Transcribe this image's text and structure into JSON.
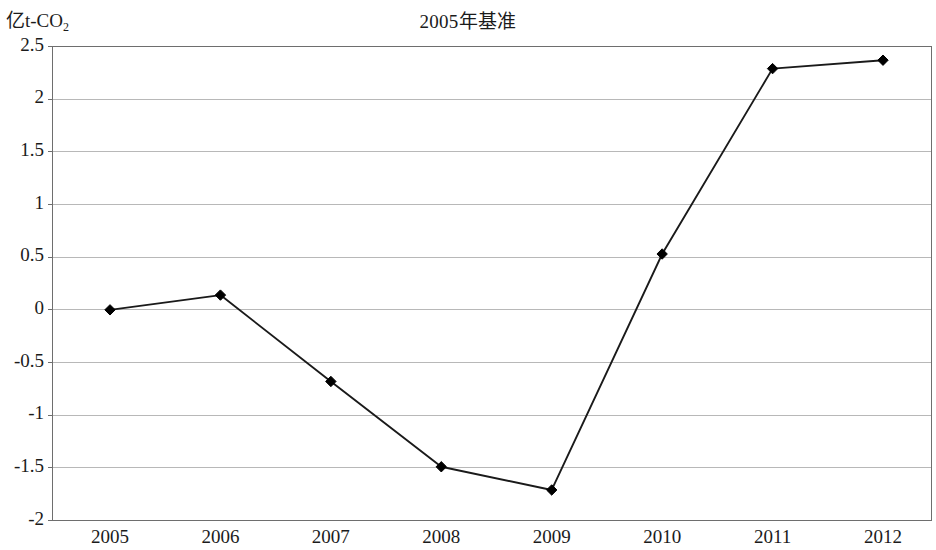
{
  "chart_data": {
    "type": "line",
    "title": "2005年基准",
    "ylabel": "亿t-CO",
    "ylabel_sub": "2",
    "xlabel": "",
    "categories": [
      "2005",
      "2006",
      "2007",
      "2008",
      "2009",
      "2010",
      "2011",
      "2012"
    ],
    "values": [
      0,
      0.14,
      -0.68,
      -1.49,
      -1.71,
      0.53,
      2.29,
      2.37
    ],
    "series": [
      {
        "name": "2005年基准",
        "values": [
          0,
          0.14,
          -0.68,
          -1.49,
          -1.71,
          0.53,
          2.29,
          2.37
        ]
      }
    ],
    "ylim": [
      -2,
      2.5
    ],
    "ytick_labels": [
      "2.5",
      "2",
      "1.5",
      "1",
      "0.5",
      "0",
      "-0.5",
      "-1",
      "-1.5",
      "-2"
    ],
    "ytick_values": [
      2.5,
      2,
      1.5,
      1,
      0.5,
      0,
      -0.5,
      -1,
      -1.5,
      -2
    ],
    "grid": true,
    "grid_axis": "y",
    "legend": "none",
    "marker": "diamond",
    "line_color": "#1a1a1a",
    "marker_color": "#000000",
    "grid_color": "#b8b8b8",
    "axis_color": "#6e6e6e",
    "background_color": "#ffffff"
  }
}
